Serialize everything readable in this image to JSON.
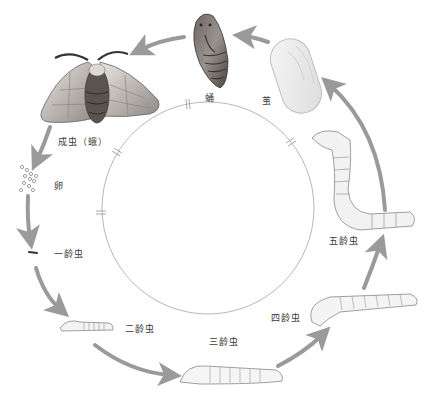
{
  "diagram": {
    "type": "life-cycle",
    "stages": [
      {
        "id": "egg",
        "label": "卵"
      },
      {
        "id": "instar-1",
        "label": "一龄虫"
      },
      {
        "id": "instar-2",
        "label": "二龄虫"
      },
      {
        "id": "instar-3",
        "label": "三龄虫"
      },
      {
        "id": "instar-4",
        "label": "四龄虫"
      },
      {
        "id": "instar-5",
        "label": "五龄虫"
      },
      {
        "id": "cocoon",
        "label": "茧"
      },
      {
        "id": "pupa",
        "label": "蛹"
      },
      {
        "id": "adult",
        "label": "成虫（蛾）"
      }
    ],
    "colors": {
      "arrow": "#9a9a9a",
      "circle": "#b8b8b8",
      "label": "#3a3a3a"
    }
  }
}
